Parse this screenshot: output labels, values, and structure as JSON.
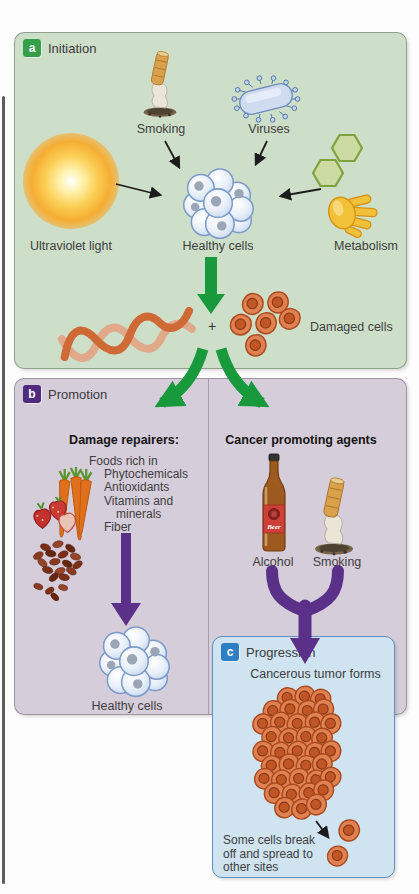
{
  "colors": {
    "panel_a_bg": "#cddfc9",
    "panel_b_bg": "#d6cdda",
    "panel_c_bg": "#cfe3f1",
    "tag_a": "#35a049",
    "tag_b": "#4f2a7d",
    "tag_c": "#2d7ec4",
    "green_arrow": "#18993b",
    "purple_arrow": "#5b3089",
    "healthy_cell": "#e9f0fa",
    "damaged_cell": "#e08152"
  },
  "panel_a": {
    "tag": "a",
    "title": "Initiation",
    "smoking_label": "Smoking",
    "viruses_label": "Viruses",
    "uv_label": "Ultraviolet light",
    "healthy_label": "Healthy cells",
    "metabolism_label": "Metabolism",
    "plus_sign": "+",
    "damaged_label": "Damaged cells"
  },
  "panel_b": {
    "tag": "b",
    "title": "Promotion",
    "left": {
      "heading": "Damage repairers:",
      "lines": [
        "Foods rich in",
        "Phytochemicals",
        "Antioxidants",
        "Vitamins and",
        "minerals",
        "Fiber"
      ],
      "healthy_label": "Healthy cells"
    },
    "right": {
      "heading": "Cancer promoting agents",
      "alcohol_label": "Alcohol",
      "smoking_label": "Smoking",
      "beer_label": "Beer"
    }
  },
  "panel_c": {
    "tag": "c",
    "title": "Progression",
    "heading": "Cancerous tumor forms",
    "note": "Some cells break off and spread to other sites"
  }
}
